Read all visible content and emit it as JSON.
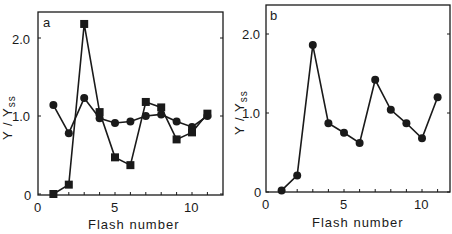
{
  "chart_data": [
    {
      "type": "line",
      "panel": "a",
      "title": "",
      "xlabel": "Flash number",
      "ylabel": "Y / Yss",
      "xlim": [
        0,
        12
      ],
      "ylim": [
        0,
        2.4
      ],
      "xticks": [
        0,
        5,
        10
      ],
      "yticks": [
        0,
        1.0,
        2.0
      ],
      "ytick_labels": [
        "0",
        "1.0",
        "2.0"
      ],
      "grid": false,
      "x": [
        1,
        2,
        3,
        4,
        5,
        6,
        7,
        8,
        9,
        10,
        11
      ],
      "series": [
        {
          "name": "circles",
          "marker": "circle",
          "values": [
            1.14,
            0.78,
            1.23,
            0.97,
            0.91,
            0.93,
            1.0,
            1.02,
            0.93,
            0.86,
            1.0
          ]
        },
        {
          "name": "squares",
          "marker": "square",
          "values": [
            0.0,
            0.12,
            2.18,
            1.05,
            0.47,
            0.37,
            1.18,
            1.11,
            0.7,
            0.79,
            1.03
          ]
        }
      ]
    },
    {
      "type": "line",
      "panel": "b",
      "title": "",
      "xlabel": "Flash number",
      "ylabel": "Y / Yss",
      "xlim": [
        0,
        12
      ],
      "ylim": [
        0,
        2.4
      ],
      "xticks": [
        0,
        5,
        10
      ],
      "yticks": [
        0,
        1.0,
        2.0
      ],
      "ytick_labels": [
        "0",
        "1.0",
        "2.0"
      ],
      "grid": false,
      "x": [
        1,
        2,
        3,
        4,
        5,
        6,
        7,
        8,
        9,
        10,
        11
      ],
      "series": [
        {
          "name": "circles",
          "marker": "circle",
          "values": [
            0.02,
            0.21,
            1.86,
            0.87,
            0.75,
            0.62,
            1.42,
            1.04,
            0.87,
            0.68,
            1.2
          ]
        }
      ]
    }
  ],
  "panels": {
    "a": {
      "label": "a",
      "xlabel": "Flash number",
      "ylabel_main": "Y / Y",
      "ylabel_sub": "ss",
      "xtick_labels": [
        "0",
        "5",
        "10"
      ],
      "ytick_labels": [
        "0",
        "1.0",
        "2.0"
      ]
    },
    "b": {
      "label": "b",
      "xlabel": "Flash number",
      "ylabel_main": "Y / Y",
      "ylabel_sub": "ss",
      "xtick_labels": [
        "0",
        "5",
        "10"
      ],
      "ytick_labels": [
        "0",
        "1.0",
        "2.0"
      ]
    }
  },
  "colors": {
    "ink": "#1a1a1a",
    "background": "#ffffff"
  }
}
